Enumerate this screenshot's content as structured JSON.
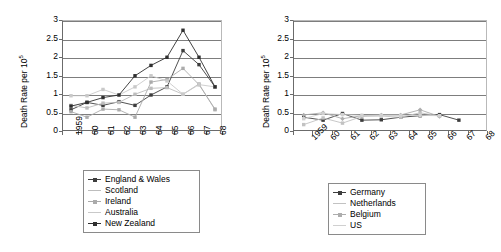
{
  "figure": {
    "axis_title_y": "Death Rate per 10",
    "axis_title_y_exponent": "5"
  },
  "chart_data": [
    {
      "type": "line",
      "id": "left",
      "title": "",
      "xlabel": "",
      "ylabel": "Death Rate per 10^5",
      "ylim": [
        0,
        3
      ],
      "yticks": [
        "0",
        "0.5",
        "1",
        "1.5",
        "2",
        "2.5",
        "3"
      ],
      "ytick_values": [
        0,
        0.5,
        1,
        1.5,
        2,
        2.5,
        3
      ],
      "grid": true,
      "legend_position": "below",
      "categories": [
        "1959",
        "60",
        "61",
        "62",
        "63",
        "64",
        "65",
        "66",
        "67",
        "68"
      ],
      "series": [
        {
          "name": "England & Wales",
          "color": "#3d3d3d",
          "marker": "square",
          "values": [
            0.6,
            0.8,
            0.72,
            0.82,
            0.72,
            1.0,
            1.22,
            2.2,
            1.82,
            1.22
          ]
        },
        {
          "name": "Scotland",
          "color": "#bdbdbd",
          "marker": "square",
          "values": [
            0.72,
            0.65,
            0.78,
            0.8,
            1.02,
            1.18,
            1.2,
            1.02,
            1.3,
            0.6
          ]
        },
        {
          "name": "Ireland",
          "color": "#ababab",
          "marker": "square",
          "values": [
            0.55,
            0.4,
            0.62,
            0.6,
            0.4,
            1.35,
            1.42,
            1.72,
            1.28,
            0.62
          ]
        },
        {
          "name": "Australia",
          "color": "#c9c9c9",
          "marker": "square",
          "values": [
            0.98,
            0.98,
            1.15,
            1.0,
            1.22,
            1.52,
            1.38,
            1.02,
            1.28,
            1.22
          ]
        },
        {
          "name": "New Zealand",
          "color": "#2f2f2f",
          "marker": "square",
          "values": [
            0.7,
            0.8,
            0.93,
            1.0,
            1.52,
            1.8,
            2.02,
            2.75,
            2.02,
            1.22
          ]
        }
      ]
    },
    {
      "type": "line",
      "id": "right",
      "title": "",
      "xlabel": "",
      "ylabel": "Death Rate per 10^5",
      "ylim": [
        0,
        3
      ],
      "yticks": [
        "0",
        "0.5",
        "1",
        "1.5",
        "2",
        "2.5",
        "3"
      ],
      "ytick_values": [
        0,
        0.5,
        1,
        1.5,
        2,
        2.5,
        3
      ],
      "grid": true,
      "legend_position": "below",
      "categories": [
        "1959",
        "60",
        "61",
        "62",
        "63",
        "64",
        "65",
        "66",
        "67",
        "68"
      ],
      "series": [
        {
          "name": "Germany",
          "color": "#3d3d3d",
          "marker": "square",
          "values": [
            0.4,
            0.32,
            0.5,
            0.32,
            0.33,
            0.4,
            0.44,
            0.47,
            0.32,
            null
          ]
        },
        {
          "name": "Netherlands",
          "color": "#c2c2c2",
          "marker": "square",
          "values": [
            0.2,
            0.38,
            0.24,
            0.42,
            0.43,
            0.4,
            0.52,
            0.43,
            null,
            null
          ]
        },
        {
          "name": "Belgium",
          "color": "#adadad",
          "marker": "diamond",
          "values": [
            0.46,
            0.52,
            0.36,
            0.44,
            0.46,
            0.46,
            0.6,
            0.42,
            null,
            null
          ]
        },
        {
          "name": "US",
          "color": "#d0d0d0",
          "marker": "square",
          "values": [
            0.36,
            0.5,
            0.47,
            0.45,
            0.45,
            0.45,
            0.45,
            0.44,
            null,
            null
          ]
        }
      ]
    }
  ],
  "legends": [
    {
      "id": "left-legend",
      "items": [
        {
          "label": "England & Wales",
          "color": "#3d3d3d",
          "marker": true
        },
        {
          "label": "Scotland",
          "color": "#bdbdbd",
          "marker": false
        },
        {
          "label": "Ireland",
          "color": "#ababab",
          "marker": true
        },
        {
          "label": "Australia",
          "color": "#c9c9c9",
          "marker": false
        },
        {
          "label": "New Zealand",
          "color": "#2f2f2f",
          "marker": true
        }
      ]
    },
    {
      "id": "right-legend",
      "items": [
        {
          "label": "Germany",
          "color": "#3d3d3d",
          "marker": true
        },
        {
          "label": "Netherlands",
          "color": "#c2c2c2",
          "marker": false
        },
        {
          "label": "Belgium",
          "color": "#adadad",
          "marker": true
        },
        {
          "label": "US",
          "color": "#d0d0d0",
          "marker": false
        }
      ]
    }
  ]
}
